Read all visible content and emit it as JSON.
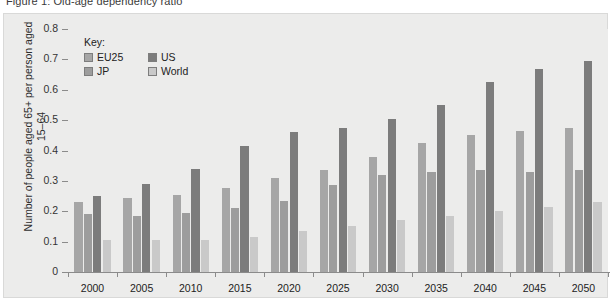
{
  "title": "Figure 1: Old-age dependency ratio",
  "chart_data": {
    "type": "bar",
    "title": "Old-age dependency ratio",
    "xlabel": "",
    "ylabel": "Number of people aged 65+ per person aged 15–64",
    "ylim": [
      0,
      0.8
    ],
    "ytick_labels": [
      "0",
      "0.1",
      "0.2",
      "0.3",
      "0.4",
      "0.5",
      "0.6",
      "0.7",
      "0.8"
    ],
    "ytick_values": [
      0,
      0.1,
      0.2,
      0.3,
      0.4,
      0.5,
      0.6,
      0.7,
      0.8
    ],
    "grid": false,
    "legend_position": "top-left",
    "legend_title": "Key:",
    "categories": [
      "2000",
      "2005",
      "2010",
      "2015",
      "2020",
      "2025",
      "2030",
      "2035",
      "2040",
      "2045",
      "2050"
    ],
    "series": [
      {
        "name": "EU25",
        "color": "#a6a6a6",
        "values": [
          0.23,
          0.245,
          0.255,
          0.275,
          0.31,
          0.335,
          0.38,
          0.425,
          0.45,
          0.465,
          0.475
        ]
      },
      {
        "name": "JP",
        "color": "#9d9d9d",
        "values": [
          0.19,
          0.185,
          0.195,
          0.21,
          0.235,
          0.285,
          0.32,
          0.33,
          0.335,
          0.33,
          0.335
        ]
      },
      {
        "name": "US",
        "color": "#7c7c7c",
        "values": [
          0.25,
          0.29,
          0.34,
          0.415,
          0.46,
          0.475,
          0.505,
          0.55,
          0.625,
          0.67,
          0.695
        ]
      },
      {
        "name": "World",
        "color": "#c9c9c9",
        "values": [
          0.105,
          0.105,
          0.105,
          0.115,
          0.135,
          0.15,
          0.17,
          0.185,
          0.2,
          0.215,
          0.23
        ]
      }
    ]
  },
  "colors": {
    "panel_background": "#ececeb",
    "axis": "#8b8b8b",
    "text": "#222222"
  }
}
